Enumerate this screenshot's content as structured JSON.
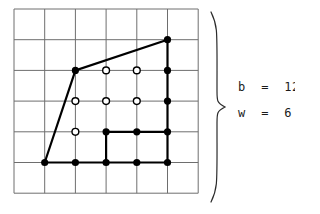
{
  "figure": {
    "type": "lattice-polygon-diagram",
    "grid": {
      "cols": 6,
      "rows": 6,
      "origin_x": 14,
      "origin_y": 9,
      "cell": 30.7,
      "line_color": "#6e6e6e",
      "line_width": 1
    },
    "polygon": {
      "stroke": "#000000",
      "stroke_width": 2.2,
      "vertices_grid": [
        [
          1,
          5
        ],
        [
          2,
          2
        ],
        [
          5,
          1
        ],
        [
          5,
          5
        ]
      ],
      "inner_step_path_grid": [
        [
          3,
          5
        ],
        [
          3,
          4
        ],
        [
          5,
          4
        ]
      ]
    },
    "boundary_points_grid": [
      [
        1,
        5
      ],
      [
        2,
        5
      ],
      [
        3,
        5
      ],
      [
        4,
        5
      ],
      [
        5,
        5
      ],
      [
        5,
        4
      ],
      [
        5,
        3
      ],
      [
        5,
        2
      ],
      [
        5,
        1
      ],
      [
        2,
        2
      ],
      [
        3,
        4
      ],
      [
        4,
        4
      ]
    ],
    "interior_points_grid": [
      [
        3,
        2
      ],
      [
        4,
        2
      ],
      [
        2,
        3
      ],
      [
        3,
        3
      ],
      [
        4,
        3
      ],
      [
        2,
        4
      ]
    ],
    "point_style": {
      "filled_fill": "#000000",
      "filled_radius": 3.6,
      "open_fill": "#ffffff",
      "open_stroke": "#000000",
      "open_radius": 3.4,
      "open_stroke_width": 1.4
    },
    "brace": {
      "stroke": "#2b2b2b",
      "stroke_width": 1.2,
      "x": 218,
      "y_top": 12,
      "y_bottom": 202
    }
  },
  "labels": {
    "boundary_label": "b  =  12",
    "interior_label": "w  =  6",
    "boundary_symbol": "b",
    "boundary_value": "12",
    "interior_symbol": "w",
    "interior_value": "6"
  }
}
